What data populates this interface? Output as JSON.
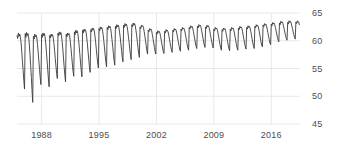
{
  "chart_data": {
    "type": "line",
    "title": "",
    "subtitle": "",
    "xlabel": "",
    "ylabel": "",
    "grid": true,
    "legend": null,
    "legend_position": "none",
    "y_axis_side": "right",
    "xlim": [
      1985.0,
      2019.5
    ],
    "ylim": [
      45,
      65
    ],
    "y_ticks": [
      65,
      60,
      55,
      50,
      45
    ],
    "y_tick_labels": [
      "65",
      "60",
      "55",
      "50",
      "45"
    ],
    "x_ticks": [
      1988,
      1995,
      2002,
      2009,
      2016
    ],
    "x_tick_labels": [
      "1988",
      "1995",
      "2002",
      "2009",
      "2016"
    ],
    "line_color": "#3a3a3a",
    "grid_color": "#e2e2e6",
    "axis_text_color": "#4d4d4d",
    "background_color": "#ffffff",
    "series": [
      {
        "name": "series-1",
        "x": [
          1985.0,
          1985.083,
          1985.167,
          1985.25,
          1985.333,
          1985.417,
          1985.5,
          1985.583,
          1985.667,
          1985.75,
          1985.833,
          1985.917,
          1986.0,
          1986.083,
          1986.167,
          1986.25,
          1986.333,
          1986.417,
          1986.5,
          1986.583,
          1986.667,
          1986.75,
          1986.833,
          1986.917,
          1987.0,
          1987.083,
          1987.167,
          1987.25,
          1987.333,
          1987.417,
          1987.5,
          1987.583,
          1987.667,
          1987.75,
          1987.833,
          1987.917,
          1988.0,
          1988.083,
          1988.167,
          1988.25,
          1988.333,
          1988.417,
          1988.5,
          1988.583,
          1988.667,
          1988.75,
          1988.833,
          1988.917,
          1989.0,
          1989.083,
          1989.167,
          1989.25,
          1989.333,
          1989.417,
          1989.5,
          1989.583,
          1989.667,
          1989.75,
          1989.833,
          1989.917,
          1990.0,
          1990.083,
          1990.167,
          1990.25,
          1990.333,
          1990.417,
          1990.5,
          1990.583,
          1990.667,
          1990.75,
          1990.833,
          1990.917,
          1991.0,
          1991.083,
          1991.167,
          1991.25,
          1991.333,
          1991.417,
          1991.5,
          1991.583,
          1991.667,
          1991.75,
          1991.833,
          1991.917,
          1992.0,
          1992.083,
          1992.167,
          1992.25,
          1992.333,
          1992.417,
          1992.5,
          1992.583,
          1992.667,
          1992.75,
          1992.833,
          1992.917,
          1993.0,
          1993.083,
          1993.167,
          1993.25,
          1993.333,
          1993.417,
          1993.5,
          1993.583,
          1993.667,
          1993.75,
          1993.833,
          1993.917,
          1994.0,
          1994.083,
          1994.167,
          1994.25,
          1994.333,
          1994.417,
          1994.5,
          1994.583,
          1994.667,
          1994.75,
          1994.833,
          1994.917,
          1995.0,
          1995.083,
          1995.167,
          1995.25,
          1995.333,
          1995.417,
          1995.5,
          1995.583,
          1995.667,
          1995.75,
          1995.833,
          1995.917,
          1996.0,
          1996.083,
          1996.167,
          1996.25,
          1996.333,
          1996.417,
          1996.5,
          1996.583,
          1996.667,
          1996.75,
          1996.833,
          1996.917,
          1997.0,
          1997.083,
          1997.167,
          1997.25,
          1997.333,
          1997.417,
          1997.5,
          1997.583,
          1997.667,
          1997.75,
          1997.833,
          1997.917,
          1998.0,
          1998.083,
          1998.167,
          1998.25,
          1998.333,
          1998.417,
          1998.5,
          1998.583,
          1998.667,
          1998.75,
          1998.833,
          1998.917,
          1999.0,
          1999.083,
          1999.167,
          1999.25,
          1999.333,
          1999.417,
          1999.5,
          1999.583,
          1999.667,
          1999.75,
          1999.833,
          1999.917,
          2000.0,
          2000.083,
          2000.167,
          2000.25,
          2000.333,
          2000.417,
          2000.5,
          2000.583,
          2000.667,
          2000.75,
          2000.833,
          2000.917,
          2001.0,
          2001.083,
          2001.167,
          2001.25,
          2001.333,
          2001.417,
          2001.5,
          2001.583,
          2001.667,
          2001.75,
          2001.833,
          2001.917,
          2002.0,
          2002.083,
          2002.167,
          2002.25,
          2002.333,
          2002.417,
          2002.5,
          2002.583,
          2002.667,
          2002.75,
          2002.833,
          2002.917,
          2003.0,
          2003.083,
          2003.167,
          2003.25,
          2003.333,
          2003.417,
          2003.5,
          2003.583,
          2003.667,
          2003.75,
          2003.833,
          2003.917,
          2004.0,
          2004.083,
          2004.167,
          2004.25,
          2004.333,
          2004.417,
          2004.5,
          2004.583,
          2004.667,
          2004.75,
          2004.833,
          2004.917,
          2005.0,
          2005.083,
          2005.167,
          2005.25,
          2005.333,
          2005.417,
          2005.5,
          2005.583,
          2005.667,
          2005.75,
          2005.833,
          2005.917,
          2006.0,
          2006.083,
          2006.167,
          2006.25,
          2006.333,
          2006.417,
          2006.5,
          2006.583,
          2006.667,
          2006.75,
          2006.833,
          2006.917,
          2007.0,
          2007.083,
          2007.167,
          2007.25,
          2007.333,
          2007.417,
          2007.5,
          2007.583,
          2007.667,
          2007.75,
          2007.833,
          2007.917,
          2008.0,
          2008.083,
          2008.167,
          2008.25,
          2008.333,
          2008.417,
          2008.5,
          2008.583,
          2008.667,
          2008.75,
          2008.833,
          2008.917,
          2009.0,
          2009.083,
          2009.167,
          2009.25,
          2009.333,
          2009.417,
          2009.5,
          2009.583,
          2009.667,
          2009.75,
          2009.833,
          2009.917,
          2010.0,
          2010.083,
          2010.167,
          2010.25,
          2010.333,
          2010.417,
          2010.5,
          2010.583,
          2010.667,
          2010.75,
          2010.833,
          2010.917,
          2011.0,
          2011.083,
          2011.167,
          2011.25,
          2011.333,
          2011.417,
          2011.5,
          2011.583,
          2011.667,
          2011.75,
          2011.833,
          2011.917,
          2012.0,
          2012.083,
          2012.167,
          2012.25,
          2012.333,
          2012.417,
          2012.5,
          2012.583,
          2012.667,
          2012.75,
          2012.833,
          2012.917,
          2013.0,
          2013.083,
          2013.167,
          2013.25,
          2013.333,
          2013.417,
          2013.5,
          2013.583,
          2013.667,
          2013.75,
          2013.833,
          2013.917,
          2014.0,
          2014.083,
          2014.167,
          2014.25,
          2014.333,
          2014.417,
          2014.5,
          2014.583,
          2014.667,
          2014.75,
          2014.833,
          2014.917,
          2015.0,
          2015.083,
          2015.167,
          2015.25,
          2015.333,
          2015.417,
          2015.5,
          2015.583,
          2015.667,
          2015.75,
          2015.833,
          2015.917,
          2016.0,
          2016.083,
          2016.167,
          2016.25,
          2016.333,
          2016.417,
          2016.5,
          2016.583,
          2016.667,
          2016.75,
          2016.833,
          2016.917,
          2017.0,
          2017.083,
          2017.167,
          2017.25,
          2017.333,
          2017.417,
          2017.5,
          2017.583,
          2017.667,
          2017.75,
          2017.833,
          2017.917,
          2018.0,
          2018.083,
          2018.167,
          2018.25,
          2018.333,
          2018.417,
          2018.5,
          2018.583,
          2018.667,
          2018.75,
          2018.833,
          2018.917,
          2019.0,
          2019.083,
          2019.167,
          2019.25,
          2019.333,
          2019.417
        ],
        "values": [
          60.9,
          60.4,
          61.4,
          60.8,
          61.2,
          60.6,
          59.6,
          58.0,
          56.2,
          54.6,
          52.8,
          51.3,
          61.3,
          60.6,
          61.5,
          60.9,
          61.3,
          60.7,
          59.4,
          57.6,
          55.5,
          53.4,
          51.0,
          48.9,
          60.8,
          60.3,
          61.2,
          60.7,
          61.0,
          60.5,
          59.3,
          57.9,
          56.3,
          54.8,
          53.3,
          52.1,
          61.1,
          60.6,
          61.4,
          60.9,
          61.3,
          60.8,
          59.6,
          58.1,
          56.4,
          54.7,
          53.1,
          51.7,
          61.0,
          60.5,
          61.2,
          60.8,
          61.1,
          60.6,
          59.5,
          58.2,
          56.8,
          55.4,
          54.1,
          53.2,
          61.4,
          60.9,
          61.6,
          61.1,
          61.5,
          61.0,
          59.9,
          58.5,
          56.9,
          55.3,
          53.8,
          52.6,
          61.2,
          60.7,
          61.4,
          61.0,
          61.3,
          60.9,
          59.8,
          58.6,
          57.2,
          55.8,
          54.5,
          53.6,
          61.6,
          61.1,
          61.9,
          61.4,
          61.8,
          61.3,
          60.3,
          59.0,
          57.5,
          56.0,
          54.6,
          53.5,
          61.9,
          61.4,
          62.1,
          61.7,
          62.0,
          61.6,
          60.6,
          59.4,
          58.0,
          56.6,
          55.3,
          54.3,
          62.0,
          61.6,
          62.3,
          61.9,
          62.2,
          61.8,
          60.9,
          59.8,
          58.5,
          57.2,
          56.0,
          55.1,
          62.2,
          61.8,
          62.5,
          62.1,
          62.4,
          62.0,
          61.1,
          60.0,
          58.7,
          57.4,
          56.2,
          55.3,
          62.4,
          62.0,
          62.7,
          62.3,
          62.6,
          62.2,
          61.3,
          60.2,
          59.0,
          57.7,
          56.5,
          55.6,
          62.6,
          62.2,
          62.9,
          62.5,
          62.8,
          62.4,
          61.6,
          60.6,
          59.4,
          58.2,
          57.0,
          56.2,
          62.8,
          62.4,
          63.1,
          62.7,
          63.0,
          62.6,
          61.8,
          60.8,
          59.7,
          58.5,
          57.4,
          56.6,
          62.9,
          62.5,
          63.2,
          62.8,
          63.1,
          62.7,
          61.9,
          61.0,
          59.9,
          58.8,
          57.7,
          57.0,
          62.5,
          62.2,
          62.8,
          62.5,
          62.7,
          62.4,
          61.7,
          60.9,
          60.0,
          59.1,
          58.2,
          57.6,
          61.9,
          61.6,
          62.2,
          61.9,
          62.1,
          61.8,
          61.1,
          60.4,
          59.6,
          58.8,
          58.1,
          57.6,
          61.5,
          61.2,
          61.8,
          61.5,
          61.7,
          61.4,
          60.8,
          60.1,
          59.4,
          58.7,
          58.1,
          57.7,
          61.7,
          61.4,
          62.0,
          61.7,
          61.9,
          61.6,
          61.0,
          60.3,
          59.6,
          58.9,
          58.3,
          57.9,
          61.9,
          61.6,
          62.2,
          61.9,
          62.1,
          61.8,
          61.2,
          60.5,
          59.8,
          59.1,
          58.5,
          58.1,
          62.1,
          61.8,
          62.4,
          62.1,
          62.3,
          62.0,
          61.4,
          60.7,
          60.0,
          59.3,
          58.7,
          58.3,
          62.4,
          62.1,
          62.7,
          62.4,
          62.6,
          62.3,
          61.7,
          61.0,
          60.3,
          59.6,
          59.0,
          58.6,
          62.6,
          62.3,
          62.9,
          62.6,
          62.8,
          62.5,
          61.9,
          61.2,
          60.5,
          59.8,
          59.2,
          58.8,
          62.5,
          62.2,
          62.8,
          62.5,
          62.7,
          62.4,
          61.8,
          61.1,
          60.4,
          59.7,
          59.1,
          58.7,
          62.1,
          61.8,
          62.4,
          62.1,
          62.3,
          62.0,
          61.4,
          60.7,
          60.0,
          59.3,
          58.7,
          58.3,
          62.0,
          61.7,
          62.3,
          62.0,
          62.2,
          61.9,
          61.3,
          60.6,
          59.9,
          59.2,
          58.6,
          58.2,
          62.1,
          61.8,
          62.4,
          62.1,
          62.3,
          62.0,
          61.4,
          60.7,
          60.0,
          59.3,
          58.7,
          58.3,
          62.3,
          62.0,
          62.6,
          62.3,
          62.5,
          62.2,
          61.6,
          60.9,
          60.2,
          59.5,
          58.9,
          58.5,
          62.4,
          62.1,
          62.7,
          62.4,
          62.6,
          62.3,
          61.7,
          61.0,
          60.3,
          59.6,
          59.0,
          58.6,
          62.6,
          62.3,
          62.9,
          62.6,
          62.8,
          62.5,
          61.9,
          61.2,
          60.5,
          59.8,
          59.2,
          58.9,
          62.8,
          62.5,
          63.1,
          62.8,
          63.0,
          62.7,
          62.1,
          61.5,
          60.8,
          60.2,
          59.6,
          59.3,
          63.0,
          62.7,
          63.3,
          63.0,
          63.2,
          62.9,
          62.4,
          61.8,
          61.2,
          60.6,
          60.1,
          59.8,
          63.2,
          62.9,
          63.5,
          63.2,
          63.4,
          63.1,
          62.6,
          62.0,
          61.4,
          60.9,
          60.4,
          60.1,
          63.3,
          63.0,
          63.6,
          63.3,
          63.5,
          63.2,
          62.7,
          62.2,
          61.6,
          61.1,
          60.6,
          60.3,
          63.4,
          63.1,
          63.6,
          63.3,
          63.4,
          62.9
        ]
      }
    ]
  },
  "plot_geometry": {
    "left": 17,
    "right": 300,
    "top": 13,
    "bottom": 124
  }
}
